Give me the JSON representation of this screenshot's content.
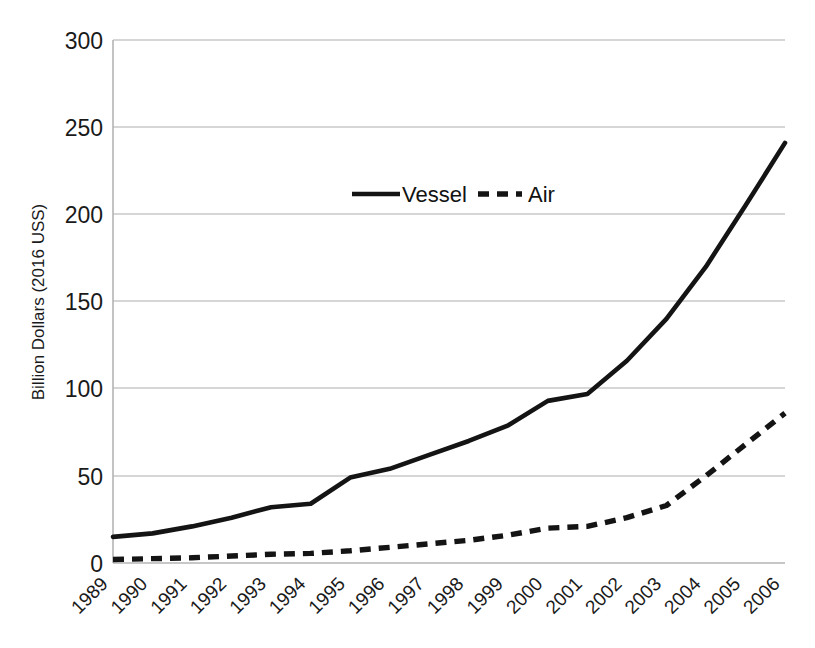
{
  "chart_data": {
    "type": "line",
    "title": "",
    "subtitle": "",
    "xlabel": "",
    "ylabel": "Billion Dollars (2016 USS)",
    "categories": [
      "1989",
      "1990",
      "1991",
      "1992",
      "1993",
      "1994",
      "1995",
      "1996",
      "1997",
      "1998",
      "1999",
      "2000",
      "2001",
      "2002",
      "2003",
      "2004",
      "2005",
      "2006"
    ],
    "series": [
      {
        "name": "Vessel",
        "style": "solid",
        "color": "#141414",
        "values": [
          15,
          17,
          21,
          26,
          32,
          34,
          49,
          54,
          62,
          70,
          79,
          93,
          97,
          116,
          140,
          170,
          205,
          241
        ]
      },
      {
        "name": "Air",
        "style": "dashed",
        "color": "#141414",
        "values": [
          2,
          2.5,
          3,
          4,
          5,
          5.5,
          7,
          9,
          11,
          13,
          16,
          20,
          21,
          26,
          33,
          50,
          68,
          86
        ]
      }
    ],
    "ylim": [
      0,
      300
    ],
    "yticks": [
      0,
      50,
      100,
      150,
      200,
      250,
      300
    ],
    "ytick_labels": [
      "0",
      "50",
      "100",
      "150",
      "200",
      "250",
      "300"
    ],
    "grid": "horizontal",
    "legend_position": "inside-top-center",
    "xtick_rotation": 45
  },
  "legend": {
    "items": [
      {
        "label": "Vessel",
        "style": "solid"
      },
      {
        "label": "Air",
        "style": "dashed"
      }
    ]
  },
  "axes": {
    "y_axis_title": "Billion Dollars (2016 USS)"
  }
}
